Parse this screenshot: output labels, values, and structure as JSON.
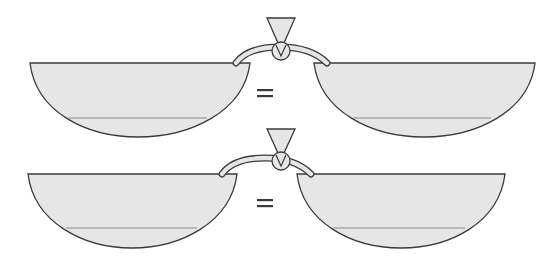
{
  "diagram": {
    "title": "",
    "colors": {
      "fill": "#e6e6e6",
      "outline": "#3a3a3a",
      "level_line": "#8a8a8a",
      "background": "#ffffff"
    },
    "rows": [
      {
        "id": "top",
        "left_bowl": {
          "name": "left-bowl",
          "has_level_line": true
        },
        "right_bowl": {
          "name": "right-bowl",
          "has_level_line": true
        },
        "connector": {
          "funnel": true,
          "valve": "circle-with-v",
          "tube": "curved"
        },
        "relation_symbol": "="
      },
      {
        "id": "bottom",
        "left_bowl": {
          "name": "left-bowl",
          "has_level_line": true
        },
        "right_bowl": {
          "name": "right-bowl",
          "has_level_line": true
        },
        "connector": {
          "funnel": true,
          "valve": "circle-with-v",
          "tube": "curved"
        },
        "relation_symbol": "="
      }
    ]
  }
}
